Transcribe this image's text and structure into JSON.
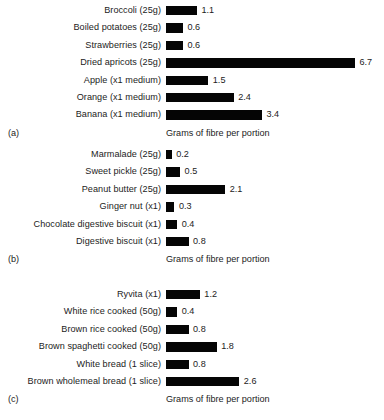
{
  "chart_data": [
    {
      "type": "bar",
      "orientation": "horizontal",
      "panel_tag": "(a)",
      "title": "",
      "xlabel": "Grams of fibre per portion",
      "ylabel": "",
      "xlim": [
        0,
        7
      ],
      "grid": false,
      "legend": "none",
      "categories": [
        "Broccoli (25g)",
        "Boiled potatoes (25g)",
        "Strawberries (25g)",
        "Dried apricots (25g)",
        "Apple (x1 medium)",
        "Orange (x1 medium)",
        "Banana (x1 medium)"
      ],
      "values": [
        1.1,
        0.6,
        0.6,
        6.7,
        1.5,
        2.4,
        3.4
      ],
      "value_labels": [
        "1.1",
        "0.6",
        "0.6",
        "6.7",
        "1.5",
        "2.4",
        "3.4"
      ]
    },
    {
      "type": "bar",
      "orientation": "horizontal",
      "panel_tag": "(b)",
      "title": "",
      "xlabel": "Grams of fibre per portion",
      "ylabel": "",
      "xlim": [
        0,
        7
      ],
      "grid": false,
      "legend": "none",
      "categories": [
        "Marmalade (25g)",
        "Sweet pickle (25g)",
        "Peanut butter (25g)",
        "Ginger nut (x1)",
        "Chocolate digestive biscuit (x1)",
        "Digestive biscuit (x1)"
      ],
      "values": [
        0.2,
        0.5,
        2.1,
        0.3,
        0.4,
        0.8
      ],
      "value_labels": [
        "0.2",
        "0.5",
        "2.1",
        "0.3",
        "0.4",
        "0.8"
      ]
    },
    {
      "type": "bar",
      "orientation": "horizontal",
      "panel_tag": "(c)",
      "title": "",
      "xlabel": "Grams of fibre per portion",
      "ylabel": "",
      "xlim": [
        0,
        7
      ],
      "grid": false,
      "legend": "none",
      "categories": [
        "Ryvita (x1)",
        "White rice cooked (50g)",
        "Brown rice cooked (50g)",
        "Brown spaghetti cooked (50g)",
        "White bread (1 slice)",
        "Brown wholemeal bread (1 slice)"
      ],
      "values": [
        1.2,
        0.4,
        0.8,
        1.8,
        0.8,
        2.6
      ],
      "value_labels": [
        "1.2",
        "0.4",
        "0.8",
        "1.8",
        "0.8",
        "2.6"
      ]
    }
  ],
  "style": {
    "bar_color": "#050505",
    "text_color": "#1c1c1c",
    "background": "#ffffff",
    "pixels_per_gram": 28.2
  }
}
